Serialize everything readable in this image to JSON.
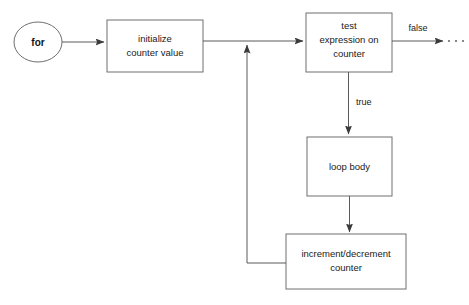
{
  "diagram": {
    "colors": {
      "background": "#ffffff",
      "shape_stroke": "#6f6f6f",
      "connector": "#5a5a5a",
      "text": "#1a1a1a"
    },
    "nodes": {
      "start": {
        "shape": "ellipse",
        "label": "for"
      },
      "initialize": {
        "shape": "rectangle",
        "label_line1": "initialize",
        "label_line2": "counter value"
      },
      "test": {
        "shape": "rectangle",
        "label_line1": "test",
        "label_line2": "expression on",
        "label_line3": "counter"
      },
      "loop_body": {
        "shape": "rectangle",
        "label": "loop body"
      },
      "increment": {
        "shape": "rectangle",
        "label_line1": "increment/decrement",
        "label_line2": "counter"
      }
    },
    "edges": {
      "false_label": "false",
      "true_label": "true",
      "continuation": "· · ·"
    }
  }
}
